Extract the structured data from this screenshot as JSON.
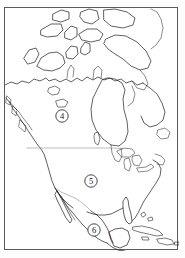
{
  "figure": {
    "type": "outline-map",
    "projection_note": "outline / blank map",
    "frame": {
      "visible": true,
      "color": "#5a5a5a"
    },
    "background_color": "#ffffff",
    "line_color": "#1d1d1d",
    "border_color": "#8d8d8d"
  },
  "map": {
    "region": "North America",
    "labels": [
      {
        "id": "label-4",
        "text": "4",
        "region_named": "Canada",
        "cx": 57,
        "cy": 108,
        "r": 6.2
      },
      {
        "id": "label-5",
        "text": "5",
        "region_named": "United States",
        "cx": 86,
        "cy": 173,
        "r": 6.2
      },
      {
        "id": "label-6",
        "text": "6",
        "region_named": "Mexico",
        "cx": 89,
        "cy": 222,
        "r": 6.2
      }
    ],
    "features": [
      {
        "name": "arctic-archipelago",
        "type": "coastline"
      },
      {
        "name": "baffin-island",
        "type": "coastline"
      },
      {
        "name": "hudson-bay",
        "type": "coastline"
      },
      {
        "name": "great-lakes",
        "type": "coastline"
      },
      {
        "name": "alaska-panhandle",
        "type": "coastline"
      },
      {
        "name": "baja-california",
        "type": "coastline"
      },
      {
        "name": "florida-peninsula",
        "type": "coastline"
      },
      {
        "name": "yucatan-peninsula",
        "type": "coastline"
      },
      {
        "name": "cuba",
        "type": "island"
      },
      {
        "name": "hispaniola",
        "type": "island"
      },
      {
        "name": "us-canada-border",
        "type": "political-border"
      },
      {
        "name": "us-mexico-border",
        "type": "political-border"
      }
    ]
  }
}
